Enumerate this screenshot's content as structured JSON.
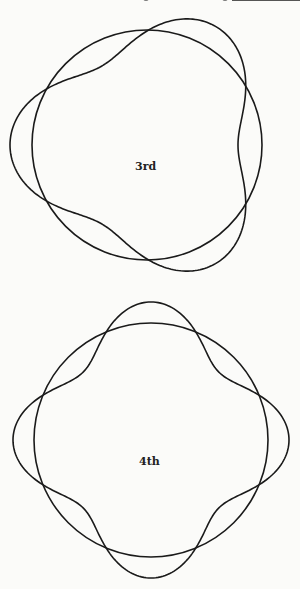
{
  "diagrams": [
    {
      "label": "3rd",
      "center": [
        147,
        145
      ],
      "circle_radius": 115,
      "wave": {
        "mode": 3,
        "base_radius": 114,
        "amplitude": 23,
        "phase_deg": 180
      }
    },
    {
      "label": "4th",
      "center": [
        151,
        440
      ],
      "circle_radius": 117,
      "wave": {
        "mode": 4,
        "base_radius": 117,
        "amplitude": 21,
        "phase_deg": 0
      }
    }
  ],
  "stroke_color": "#1a1a1a"
}
